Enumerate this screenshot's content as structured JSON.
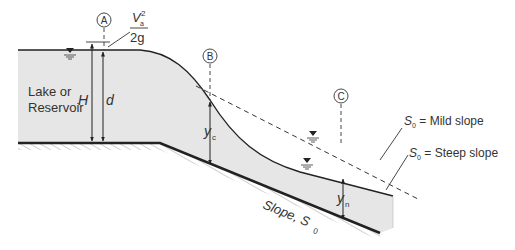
{
  "labels": {
    "section_a": "A",
    "section_b": "B",
    "section_c": "C",
    "velocity_head_num_v": "V",
    "velocity_head_sub": "a",
    "velocity_head_sup": "2",
    "velocity_head_den": "2g",
    "lake_line1": "Lake or",
    "lake_line2": "Reservoir",
    "H": "H",
    "d": "d",
    "yc": "y",
    "yc_sub": "c",
    "yn": "y",
    "yn_sub": "n",
    "slope": "Slope, S",
    "slope_sub": "0",
    "mild_S": "S",
    "mild_sub": "0",
    "mild_text": " = Mild slope",
    "steep_S": "S",
    "steep_sub": "0",
    "steep_text": " = Steep slope"
  },
  "colors": {
    "water": "#e6e6e6",
    "line": "#222222",
    "text": "#333333"
  }
}
